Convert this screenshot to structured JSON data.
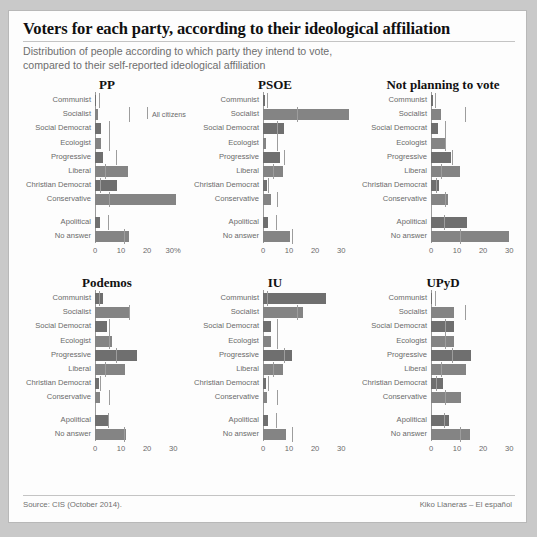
{
  "header": {
    "title": "Voters for each party, according to their ideological affiliation",
    "subtitle_line1": "Distribution of people according to which party they intend to vote,",
    "subtitle_line2": "compared to their self-reported ideological affiliation"
  },
  "legend": {
    "all_citizens_label": "All citizens"
  },
  "footer": {
    "source": "Source: CIS (October 2014).",
    "credit": "Kiko Llaneras – El español"
  },
  "colors": {
    "bar": "#6f6f6f",
    "bar_light": "#848484",
    "tick": "#9d9d9d",
    "axis": "#9a9a9a",
    "label": "#6a6a6a",
    "title": "#101010",
    "subtitle": "#6e6e6e",
    "panel_bg": "#fdfdfd",
    "page_bg": "#c9c9c9"
  },
  "chart_data": {
    "type": "bar",
    "title": "Voters for each party, according to their ideological affiliation",
    "subtitle": "Distribution of people according to which party they intend to vote, compared to their self-reported ideological affiliation",
    "xlabel": "",
    "ylabel": "",
    "orientation": "horizontal",
    "grid": false,
    "legend_position": "inside-top-left-panel",
    "legend_entries": [
      "All citizens"
    ],
    "xlim": [
      0,
      33
    ],
    "categories": [
      "Communist",
      "Socialist",
      "Social Democrat",
      "Ecologist",
      "Progressive",
      "Liberal",
      "Christian Democrat",
      "Conservative",
      "Apolitical",
      "No answer"
    ],
    "reference_series_name": "All citizens",
    "reference_values": [
      1.5,
      13.0,
      5.5,
      5.5,
      8.0,
      4.0,
      2.0,
      5.5,
      5.0,
      11.0
    ],
    "panels": [
      {
        "name": "PP",
        "xticks": [
          0,
          10,
          20,
          30
        ],
        "xticklabels": [
          "0",
          "10",
          "20",
          "30%"
        ],
        "values": [
          0.4,
          1.2,
          2.2,
          2.2,
          3.0,
          12.5,
          8.5,
          31.0,
          2.0,
          13.0
        ]
      },
      {
        "name": "PSOE",
        "xticks": [
          0,
          10,
          20,
          30
        ],
        "xticklabels": [
          "0",
          "10",
          "20",
          "30"
        ],
        "values": [
          0.6,
          33.0,
          8.0,
          1.2,
          6.5,
          7.5,
          1.5,
          3.0,
          2.0,
          10.5
        ]
      },
      {
        "name": "Not planning to vote",
        "xticks": [
          0,
          10,
          20,
          30
        ],
        "xticklabels": [
          "0",
          "10",
          "20",
          "30"
        ],
        "values": [
          0.8,
          4.0,
          2.5,
          5.5,
          7.5,
          11.0,
          3.0,
          6.5,
          14.0,
          30.0
        ]
      },
      {
        "name": "Podemos",
        "xticks": [
          0,
          10,
          20,
          30
        ],
        "xticklabels": [
          "0",
          "10",
          "20",
          "30"
        ],
        "values": [
          3.0,
          13.5,
          4.5,
          6.5,
          16.0,
          11.5,
          1.5,
          2.0,
          5.0,
          12.0
        ]
      },
      {
        "name": "IU",
        "xticks": [
          0,
          10,
          20,
          30
        ],
        "xticklabels": [
          "0",
          "10",
          "20",
          "30"
        ],
        "values": [
          24.0,
          15.5,
          3.0,
          3.0,
          11.0,
          7.5,
          1.0,
          1.5,
          2.0,
          9.0
        ]
      },
      {
        "name": "UPyD",
        "xticks": [
          0,
          10,
          20,
          30
        ],
        "xticklabels": [
          "0",
          "10",
          "20",
          "30"
        ],
        "values": [
          0.4,
          9.0,
          9.0,
          9.0,
          15.5,
          13.5,
          4.5,
          11.5,
          7.0,
          15.0
        ]
      }
    ]
  }
}
